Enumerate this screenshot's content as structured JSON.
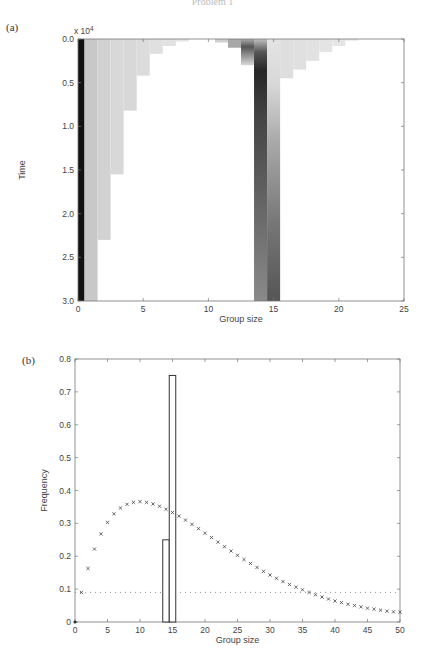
{
  "page": {
    "header_text": "Problem 1",
    "panels": [
      {
        "label": "(a)"
      },
      {
        "label": "(b)"
      }
    ]
  },
  "chart_data": [
    {
      "panel": "(a)",
      "type": "heatmap",
      "title": "",
      "xlabel": "Group size",
      "ylabel": "Time",
      "y_multiplier": "x 10^4",
      "xlim": [
        0,
        25
      ],
      "ylim": [
        0.0,
        3.0
      ],
      "y_inverted": true,
      "xticks": [
        0,
        5,
        10,
        15,
        20,
        25
      ],
      "yticks": [
        "0.0",
        "0.5",
        "1.0",
        "1.5",
        "2.0",
        "2.5",
        "3.0"
      ],
      "description": "Distribution of group sizes over time (darker = higher frequency). Group size ~0.5 stays black throughout; small groups (1-8) fade out over time; groups of 14-15 dominate at late times.",
      "columns": [
        {
          "x": 0,
          "x_end": 0.5,
          "t_end": 3.0,
          "shade": "#111111"
        },
        {
          "x": 0.5,
          "x_end": 1.5,
          "t_end": 3.0,
          "shade": "#c8c8c8"
        },
        {
          "x": 1.5,
          "x_end": 2.5,
          "t_end": 2.3,
          "shade": "#d2d2d2"
        },
        {
          "x": 2.5,
          "x_end": 3.5,
          "t_end": 1.55,
          "shade": "#d8d8d8"
        },
        {
          "x": 3.5,
          "x_end": 4.5,
          "t_end": 0.82,
          "shade": "#d8d8d8"
        },
        {
          "x": 4.5,
          "x_end": 5.5,
          "t_end": 0.42,
          "shade": "#dcdcdc"
        },
        {
          "x": 5.5,
          "x_end": 6.5,
          "t_end": 0.17,
          "shade": "#e0e0e0"
        },
        {
          "x": 6.5,
          "x_end": 7.5,
          "t_end": 0.08,
          "shade": "#e2e2e2"
        },
        {
          "x": 7.5,
          "x_end": 8.5,
          "t_end": 0.03,
          "shade": "#e6e6e6"
        },
        {
          "x": 10.5,
          "x_end": 11.5,
          "t_end": 0.04,
          "shade": "#d0d0d0"
        },
        {
          "x": 11.5,
          "x_end": 12.5,
          "t_end": 0.1,
          "shade": "#a8a8a8"
        },
        {
          "x": 12.5,
          "x_end": 13.5,
          "t_end": 0.3,
          "shade": "#909090"
        },
        {
          "x": 13.5,
          "x_end": 14.5,
          "t_end": 3.0,
          "shade": "#888888"
        },
        {
          "x": 14.5,
          "x_end": 15.5,
          "t_end": 3.0,
          "shade": "#5a5a5a"
        },
        {
          "x": 15.5,
          "x_end": 16.5,
          "t_end": 0.45,
          "shade": "#dedede"
        },
        {
          "x": 16.5,
          "x_end": 17.5,
          "t_end": 0.35,
          "shade": "#e0e0e0"
        },
        {
          "x": 17.5,
          "x_end": 18.5,
          "t_end": 0.25,
          "shade": "#e2e2e2"
        },
        {
          "x": 18.5,
          "x_end": 19.5,
          "t_end": 0.15,
          "shade": "#e4e4e4"
        },
        {
          "x": 19.5,
          "x_end": 20.5,
          "t_end": 0.08,
          "shade": "#e6e6e6"
        },
        {
          "x": 20.5,
          "x_end": 21.5,
          "t_end": 0.02,
          "shade": "#eaeaea"
        }
      ]
    },
    {
      "panel": "(b)",
      "type": "scatter",
      "title": "",
      "xlabel": "Group size",
      "ylabel": "Frequency",
      "xlim": [
        0,
        50
      ],
      "ylim": [
        0,
        0.8
      ],
      "xticks": [
        0,
        5,
        10,
        15,
        20,
        25,
        30,
        35,
        40,
        45,
        50
      ],
      "yticks": [
        "0",
        "0.1",
        "0.2",
        "0.3",
        "0.4",
        "0.5",
        "0.6",
        "0.7",
        "0.8"
      ],
      "series": [
        {
          "name": "model distribution",
          "marker": "x",
          "x": [
            1,
            2,
            3,
            4,
            5,
            6,
            7,
            8,
            9,
            10,
            11,
            12,
            13,
            14,
            15,
            16,
            17,
            18,
            19,
            20,
            21,
            22,
            23,
            24,
            25,
            26,
            27,
            28,
            29,
            30,
            31,
            32,
            33,
            34,
            35,
            36,
            37,
            38,
            39,
            40,
            41,
            42,
            43,
            44,
            45,
            46,
            47,
            48,
            49,
            50
          ],
          "values": [
            0.09,
            0.163,
            0.222,
            0.268,
            0.303,
            0.329,
            0.347,
            0.358,
            0.364,
            0.366,
            0.364,
            0.359,
            0.352,
            0.343,
            0.333,
            0.322,
            0.31,
            0.297,
            0.284,
            0.27,
            0.257,
            0.243,
            0.229,
            0.216,
            0.203,
            0.19,
            0.178,
            0.166,
            0.154,
            0.143,
            0.133,
            0.123,
            0.114,
            0.106,
            0.098,
            0.09,
            0.083,
            0.076,
            0.07,
            0.064,
            0.059,
            0.054,
            0.05,
            0.046,
            0.042,
            0.039,
            0.036,
            0.033,
            0.031,
            0.03
          ]
        },
        {
          "name": "uniform baseline",
          "marker": "dotted-line",
          "x": [
            0,
            50
          ],
          "values": [
            0.09,
            0.09
          ]
        },
        {
          "name": "simulated frequency (bars)",
          "marker": "bar-outline",
          "x": [
            14,
            15
          ],
          "values": [
            0.25,
            0.75
          ]
        }
      ]
    }
  ]
}
